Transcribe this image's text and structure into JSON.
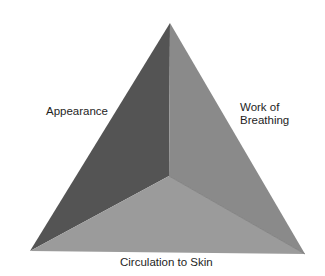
{
  "diagram": {
    "labels": {
      "appearance": "Appearance",
      "work_line1": "Work of",
      "work_line2": "Breathing",
      "circulation": "Circulation to Skin"
    },
    "faces": {
      "left": {
        "name": "Appearance",
        "color": "#545454"
      },
      "right": {
        "name": "Work of Breathing",
        "color": "#8a8a8a"
      },
      "bottom": {
        "name": "Circulation to Skin",
        "color": "#9b9b9b"
      }
    },
    "vertices": {
      "apex": [
        170,
        23
      ],
      "center": [
        169,
        176
      ],
      "bottom_left": [
        30,
        251
      ],
      "bottom_right": [
        305,
        254
      ]
    }
  }
}
